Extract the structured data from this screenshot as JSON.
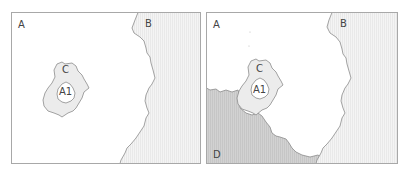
{
  "panels": [
    {
      "id": "left",
      "regions": [
        {
          "label": "A",
          "fill": "#ffffff"
        },
        {
          "label": "B",
          "fill": "#f1f1f1"
        },
        {
          "label": "C",
          "fill": "#ececec"
        },
        {
          "label": "A1",
          "fill": "#ffffff"
        }
      ]
    },
    {
      "id": "right",
      "regions": [
        {
          "label": "A",
          "fill": "#ffffff"
        },
        {
          "label": "B",
          "fill": "#f1f1f1"
        },
        {
          "label": "C",
          "fill": "#ececec"
        },
        {
          "label": "A1",
          "fill": "#ffffff"
        },
        {
          "label": "D",
          "fill": "#cfcfcf"
        }
      ]
    }
  ],
  "colors": {
    "border": "#a8a8a8",
    "outline": "#8c8c8c",
    "text": "#444444"
  }
}
